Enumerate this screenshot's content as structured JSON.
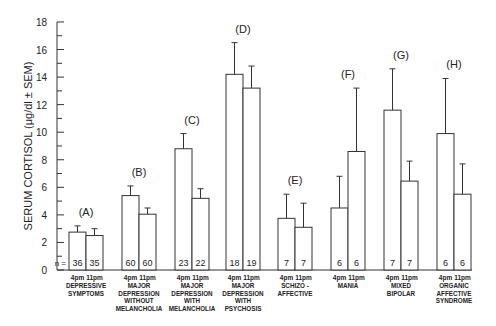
{
  "chart_data": {
    "type": "bar",
    "title": "",
    "xlabel": "",
    "ylabel": "SERUM CORTISOL (μg/dl ± SEM)",
    "ylim": [
      0,
      18
    ],
    "yticks": [
      0,
      2,
      4,
      6,
      8,
      10,
      12,
      14,
      16,
      18
    ],
    "grid": false,
    "legend": null,
    "n_label": "n =",
    "time_labels": [
      "4 pm",
      "11 pm"
    ],
    "groups": [
      {
        "letter": "(A)",
        "label": [
          "DEPRESSIVE",
          "SYMPTOMS"
        ],
        "values": [
          2.75,
          2.5
        ],
        "errors": [
          0.45,
          0.5
        ],
        "n": [
          36,
          35
        ]
      },
      {
        "letter": "(B)",
        "label": [
          "MAJOR",
          "DEPRESSION",
          "WITHOUT",
          "MELANCHOLIA"
        ],
        "values": [
          5.4,
          4.05
        ],
        "errors": [
          0.7,
          0.45
        ],
        "n": [
          60,
          60
        ]
      },
      {
        "letter": "(C)",
        "label": [
          "MAJOR",
          "DEPRESSION",
          "WITH",
          "MELANCHOLIA"
        ],
        "values": [
          8.8,
          5.2
        ],
        "errors": [
          1.1,
          0.7
        ],
        "n": [
          23,
          22
        ]
      },
      {
        "letter": "(D)",
        "label": [
          "MAJOR",
          "DEPRESSION",
          "WITH",
          "PSYCHOSIS"
        ],
        "values": [
          14.2,
          13.2
        ],
        "errors": [
          2.3,
          1.6
        ],
        "n": [
          18,
          19
        ]
      },
      {
        "letter": "(E)",
        "label": [
          "SCHIZO -",
          "AFFECTIVE"
        ],
        "values": [
          3.75,
          3.1
        ],
        "errors": [
          1.75,
          1.75
        ],
        "n": [
          7,
          7
        ]
      },
      {
        "letter": "(F)",
        "label": [
          "MANIA"
        ],
        "values": [
          4.5,
          8.6
        ],
        "errors": [
          2.3,
          4.6
        ],
        "n": [
          6,
          6
        ]
      },
      {
        "letter": "(G)",
        "label": [
          "MIXED",
          "BIPOLAR"
        ],
        "values": [
          11.6,
          6.45
        ],
        "errors": [
          3.0,
          1.45
        ],
        "n": [
          7,
          7
        ]
      },
      {
        "letter": "(H)",
        "label": [
          "ORGANIC",
          "AFFECTIVE",
          "SYNDROME"
        ],
        "values": [
          9.9,
          5.5
        ],
        "errors": [
          4.0,
          2.2
        ],
        "n": [
          6,
          6
        ]
      }
    ]
  },
  "layout": {
    "y0": 270,
    "px_per_unit": 13.78,
    "axis_x": 57,
    "axis_end_x": 472,
    "bar_width": 17,
    "group_x": [
      69,
      122,
      175,
      226,
      278,
      331,
      384,
      437
    ],
    "letter_y_offset": 14
  }
}
